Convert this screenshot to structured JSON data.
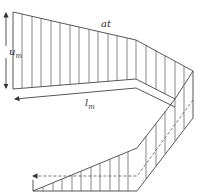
{
  "labels": {
    "top_edge": "at",
    "height_main": "u",
    "height_sub": "m",
    "length_main": "l",
    "length_sub": "m"
  },
  "colors": {
    "line": "#444444",
    "background": "#ffffff"
  }
}
